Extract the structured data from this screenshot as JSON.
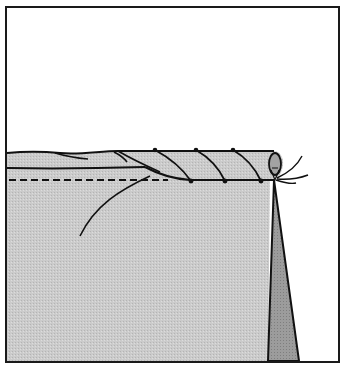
{
  "figure": {
    "caption": "",
    "colors": {
      "background": "#ffffff",
      "frame": "#1a1a1a",
      "fabric": "#c9c9c9",
      "fabric_back": "#9a9a9a",
      "roll_end": "#a8a8a8",
      "line": "#111111"
    },
    "elements": {
      "frame": "border frame",
      "fabric": "fabric panel (right side)",
      "rolled_hem": "rolled edge",
      "stitches": "diagonal whip stitches",
      "stitch_line": "dashed guide line",
      "loose_thread": "loose thread tail",
      "fold_back": "wrong side fold triangle",
      "thread_ends": "thread ends at hem end"
    }
  }
}
